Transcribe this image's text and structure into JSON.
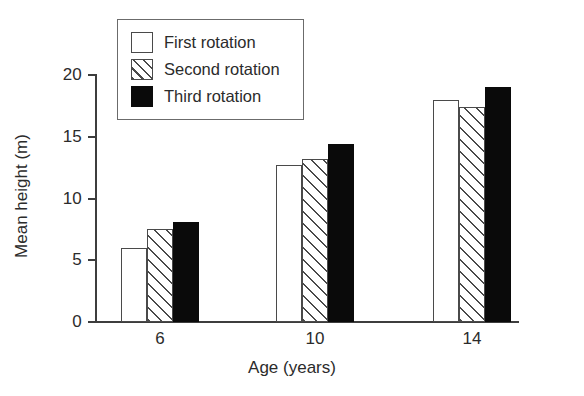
{
  "chart_data": {
    "type": "bar",
    "title": "",
    "xlabel": "Age (years)",
    "ylabel": "Mean height (m)",
    "categories": [
      "6",
      "10",
      "14"
    ],
    "series": [
      {
        "name": "First rotation",
        "pattern": "open",
        "values": [
          6.0,
          12.7,
          18.0
        ]
      },
      {
        "name": "Second rotation",
        "pattern": "hatch",
        "values": [
          7.5,
          13.2,
          17.4
        ]
      },
      {
        "name": "Third rotation",
        "pattern": "solid",
        "values": [
          8.1,
          14.4,
          19.0
        ]
      }
    ],
    "ylim": [
      0,
      20
    ],
    "yticks": [
      0,
      5,
      10,
      15,
      20
    ],
    "ytick_labels": [
      "0",
      "5",
      "10",
      "15",
      "20"
    ],
    "xtick_labels": [
      "6",
      "10",
      "14"
    ],
    "grid": false,
    "legend_position": "top-left",
    "colors": {
      "axis": "#3d3d3d",
      "outline": "#4a4a4a",
      "solid_fill": "#0a0a0a",
      "open_fill": "#ffffff",
      "text": "#2b2b2b"
    }
  },
  "legend": {
    "items": [
      {
        "label": "First rotation"
      },
      {
        "label": "Second rotation"
      },
      {
        "label": "Third rotation"
      }
    ]
  }
}
